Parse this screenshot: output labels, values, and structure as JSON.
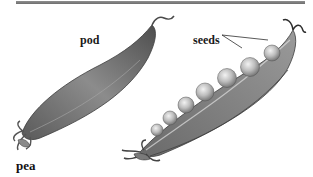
{
  "figure": {
    "labels": {
      "pod": "pod",
      "seeds": "seeds"
    },
    "caption": "pea",
    "colors": {
      "rule": "#7a7a7a",
      "pod_dark": "#4a4a4a",
      "pod_mid": "#8a8a8a",
      "pod_light": "#c8c8c8",
      "seed": "#b5b5b5",
      "text": "#111111"
    }
  }
}
